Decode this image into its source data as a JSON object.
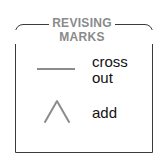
{
  "legend": {
    "title_line1": "REVISING",
    "title_line2": "MARKS",
    "items": [
      {
        "icon": "horizontal-line-icon",
        "label": "cross out"
      },
      {
        "icon": "caret-icon",
        "label": "add"
      }
    ],
    "colors": {
      "border": "#3a3a3a",
      "title": "#8a8a8a",
      "mark": "#8c8c8c",
      "text": "#111111"
    }
  }
}
